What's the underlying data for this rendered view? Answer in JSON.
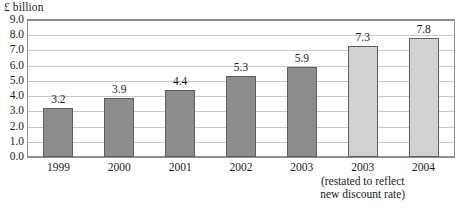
{
  "chart_data": {
    "type": "bar",
    "title": "",
    "subtitle": "",
    "xlabel": "",
    "ylabel": "£ billion",
    "ylim": [
      0.0,
      9.0
    ],
    "ytick_step": 1.0,
    "ytick_labels": [
      "9.0",
      "8.0",
      "7.0",
      "6.0",
      "5.0",
      "4.0",
      "3.0",
      "2.0",
      "1.0",
      "0.0"
    ],
    "ytick_values": [
      9.0,
      8.0,
      7.0,
      6.0,
      5.0,
      4.0,
      3.0,
      2.0,
      1.0,
      0.0
    ],
    "grid": true,
    "grid_axis": "y",
    "legend": false,
    "legend_position": "none",
    "categories": [
      "1999",
      "2000",
      "2001",
      "2002",
      "2003",
      "2003",
      "2004"
    ],
    "values": [
      3.2,
      3.9,
      4.4,
      5.3,
      5.9,
      7.3,
      7.8
    ],
    "data_labels": [
      "3.2",
      "3.9",
      "4.4",
      "5.3",
      "5.9",
      "7.3",
      "7.8"
    ],
    "bars": [
      {
        "category": "1999",
        "value": 3.2,
        "label": "3.2",
        "series": "original",
        "color": "#8d8d8d"
      },
      {
        "category": "2000",
        "value": 3.9,
        "label": "3.9",
        "series": "original",
        "color": "#8d8d8d"
      },
      {
        "category": "2001",
        "value": 4.4,
        "label": "4.4",
        "series": "original",
        "color": "#8d8d8d"
      },
      {
        "category": "2002",
        "value": 5.3,
        "label": "5.3",
        "series": "original",
        "color": "#8d8d8d"
      },
      {
        "category": "2003",
        "value": 5.9,
        "label": "5.9",
        "series": "original",
        "color": "#8d8d8d"
      },
      {
        "category": "2003",
        "value": 7.3,
        "label": "7.3",
        "series": "restated",
        "color": "#d2d2d2"
      },
      {
        "category": "2004",
        "value": 7.8,
        "label": "7.8",
        "series": "restated",
        "color": "#d2d2d2"
      }
    ],
    "annotations": [
      {
        "target_category_index": 5,
        "line1": "(restated to reflect",
        "line2": "new discount rate)"
      }
    ],
    "colors": {
      "series_original": "#8d8d8d",
      "series_restated": "#d2d2d2",
      "bar_outline": "#5e5e5e",
      "gridline": "#c9c9c9",
      "axis": "#8e8e8e",
      "text": "#1b1b1b",
      "background": "#ffffff"
    }
  },
  "scan_artifact": {
    "clipped_text": "clipped"
  }
}
